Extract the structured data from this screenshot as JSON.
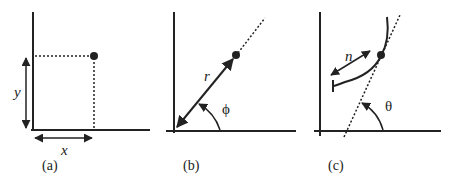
{
  "panels": [
    {
      "id": "a",
      "caption": "(a)",
      "title": "Cartesian coordinates",
      "labels": {
        "x": "x",
        "y": "y"
      }
    },
    {
      "id": "b",
      "caption": "(b)",
      "title": "Polar coordinates",
      "labels": {
        "r": "r",
        "angle": "ϕ"
      }
    },
    {
      "id": "c",
      "caption": "(c)",
      "title": "Line normal parameterization",
      "labels": {
        "n": "n",
        "angle": "θ"
      }
    }
  ],
  "colors": {
    "ink": "#222222",
    "background": "#ffffff"
  }
}
